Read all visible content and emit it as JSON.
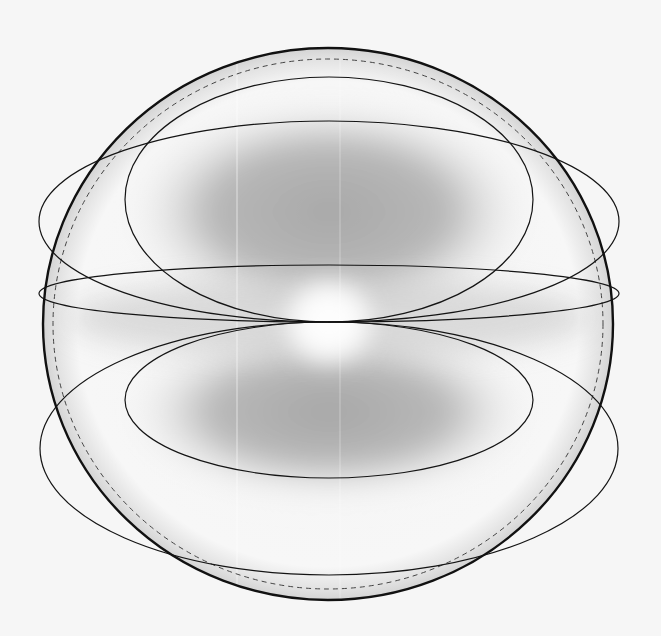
{
  "diagram": {
    "type": "geometric-figure",
    "canvas": {
      "width": 661,
      "height": 636,
      "background": "#f6f6f6"
    },
    "sphere": {
      "cx": 328,
      "cy": 324,
      "rx": 285,
      "ry": 276,
      "stroke": "#111111",
      "stroke_width": 2.4,
      "rim_fill": "#dcdcdc"
    },
    "dashed_circle": {
      "cx": 328,
      "cy": 324,
      "rx": 275,
      "ry": 265,
      "stroke": "#444444",
      "dash": "5,4",
      "stroke_width": 1
    },
    "tangent_point": {
      "x": 329,
      "y": 322
    },
    "ellipses": [
      {
        "id": "upper-inner",
        "cx": 329,
        "cy": 199.5,
        "rx": 204,
        "ry": 122.5
      },
      {
        "id": "upper-outer",
        "cx": 329,
        "cy": 221.5,
        "rx": 290,
        "ry": 100.5
      },
      {
        "id": "equator-thin",
        "cx": 329,
        "cy": 293.5,
        "rx": 290,
        "ry": 28.5
      },
      {
        "id": "lower-inner",
        "cx": 329,
        "cy": 400,
        "rx": 204,
        "ry": 78
      },
      {
        "id": "lower-outer",
        "cx": 329,
        "cy": 448.5,
        "rx": 289,
        "ry": 126.5
      }
    ],
    "ellipse_stroke": "#141414",
    "ellipse_stroke_width": 1.2,
    "shading": {
      "upper_lobe": {
        "cx": 329,
        "cy": 215,
        "rx": 200,
        "ry": 110,
        "color": "#a9a9a9"
      },
      "lower_lobe": {
        "cx": 329,
        "cy": 410,
        "rx": 200,
        "ry": 85,
        "color": "#a9a9a9"
      },
      "center_highlight": {
        "cx": 329,
        "cy": 322,
        "r": 48,
        "color": "#ffffff"
      }
    }
  }
}
